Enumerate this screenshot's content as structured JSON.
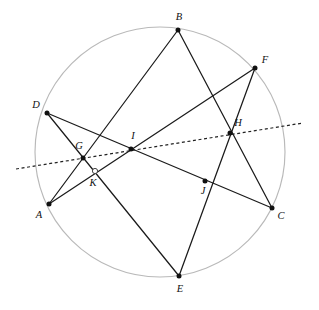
{
  "figure": {
    "type": "geometry-diagram",
    "width": 319,
    "height": 310,
    "colors": {
      "circle_stroke": "#b9b9b9",
      "chord_stroke": "#1b1b1b",
      "dashed_stroke": "#222222",
      "point_fill": "#111111",
      "background": "#ffffff"
    },
    "circle": {
      "name": "main-circle",
      "cx": 160,
      "cy": 152,
      "r": 125
    },
    "points": [
      {
        "id": "A",
        "label": "A",
        "x": 49,
        "y": 204,
        "marker": "filled",
        "label_x": 39,
        "label_y": 216
      },
      {
        "id": "B",
        "label": "B",
        "x": 178,
        "y": 30,
        "marker": "filled",
        "label_x": 179,
        "label_y": 18
      },
      {
        "id": "C",
        "label": "C",
        "x": 272,
        "y": 208,
        "marker": "filled",
        "label_x": 281,
        "label_y": 217
      },
      {
        "id": "D",
        "label": "D",
        "x": 47,
        "y": 113,
        "marker": "filled",
        "label_x": 36,
        "label_y": 106
      },
      {
        "id": "E",
        "label": "E",
        "x": 179,
        "y": 276,
        "marker": "filled",
        "label_x": 180,
        "label_y": 290
      },
      {
        "id": "F",
        "label": "F",
        "x": 255,
        "y": 68,
        "marker": "filled",
        "label_x": 265,
        "label_y": 61
      },
      {
        "id": "G",
        "label": "G",
        "x": 83,
        "y": 158,
        "marker": "filled",
        "label_x": 79,
        "label_y": 147
      },
      {
        "id": "H",
        "label": "H",
        "x": 230,
        "y": 133,
        "marker": "filled",
        "label_x": 238,
        "label_y": 124
      },
      {
        "id": "I",
        "label": "I",
        "x": 131,
        "y": 149,
        "marker": "filled",
        "label_x": 133,
        "label_y": 137
      },
      {
        "id": "J",
        "label": "J",
        "x": 205,
        "y": 181,
        "marker": "filled",
        "label_x": 203,
        "label_y": 192
      },
      {
        "id": "K",
        "label": "K",
        "x": 95,
        "y": 171,
        "marker": "open",
        "label_x": 93,
        "label_y": 184
      }
    ],
    "segments": [
      {
        "name": "segment-A-F",
        "from": "A",
        "to": "F",
        "x1": 49,
        "y1": 204,
        "x2": 255,
        "y2": 68
      },
      {
        "name": "segment-D-C",
        "from": "D",
        "to": "C",
        "x1": 47,
        "y1": 113,
        "x2": 272,
        "y2": 208
      },
      {
        "name": "segment-B-A",
        "from": "B",
        "to": "A",
        "x1": 178,
        "y1": 30,
        "x2": 49,
        "y2": 204
      },
      {
        "name": "segment-B-C",
        "from": "B",
        "to": "C",
        "x1": 178,
        "y1": 30,
        "x2": 272,
        "y2": 208
      },
      {
        "name": "segment-D-E",
        "from": "D",
        "to": "E",
        "x1": 47,
        "y1": 113,
        "x2": 179,
        "y2": 276
      },
      {
        "name": "segment-F-E",
        "from": "F",
        "to": "E",
        "x1": 255,
        "y1": 68,
        "x2": 179,
        "y2": 276
      }
    ],
    "dashed_line": {
      "name": "radical-axis-dashed-line",
      "x1": 16,
      "y1": 169,
      "x2": 303,
      "y2": 123,
      "passes_through": [
        "G",
        "I",
        "H"
      ]
    }
  }
}
